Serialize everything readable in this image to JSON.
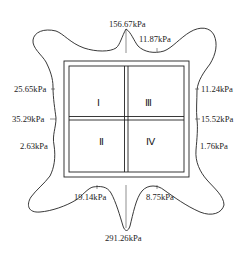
{
  "diagram": {
    "type": "pressure-distribution",
    "quadrants": [
      {
        "id": "I",
        "label": "Ⅰ"
      },
      {
        "id": "II",
        "label": "Ⅱ"
      },
      {
        "id": "III",
        "label": "Ⅲ"
      },
      {
        "id": "IV",
        "label": "Ⅳ"
      }
    ],
    "labels": {
      "top_peak": "156.67kPa",
      "top_right": "11.87kPa",
      "left_upper": "25.65kPa",
      "left_middle": "35.29kPa",
      "left_lower": "2.63kPa",
      "right_upper": "11.24kPa",
      "right_middle": "15.52kPa",
      "right_lower": "1.76kPa",
      "bottom_left": "19.14kPa",
      "bottom_right": "8.75kPa",
      "bottom_peak": "291.26kPa"
    },
    "colors": {
      "line": "#222222",
      "background": "#ffffff"
    }
  }
}
